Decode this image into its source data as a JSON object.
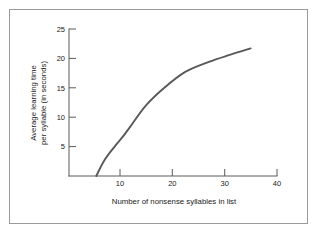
{
  "figure": {
    "background_color": "#ffffff",
    "border_color": "#9a9a9a",
    "curve_color": "#59595c",
    "axis_color": "#5a5a5a"
  },
  "chart_data": {
    "type": "line",
    "title": "",
    "xlabel": "Number of nonsense syllables in list",
    "ylabel": "Average learning time per syllable (in seconds)",
    "ylabel_line1": "Average learning time",
    "ylabel_line2": "per syllable (in seconds)",
    "xlim": [
      0,
      40
    ],
    "ylim": [
      0,
      25
    ],
    "xticks": [
      10,
      20,
      30,
      40
    ],
    "yticks": [
      5,
      10,
      15,
      20,
      25
    ],
    "xtick_labels": [
      "10",
      "20",
      "30",
      "40"
    ],
    "ytick_labels": [
      "5",
      "10",
      "15",
      "20",
      "25"
    ],
    "grid": false,
    "legend": false,
    "series": [
      {
        "name": "Average learning time per syllable",
        "x": [
          5.5,
          7.0,
          9.0,
          10.5,
          12.0,
          15.0,
          18.5,
          22.5,
          27.0,
          31.0,
          35.0
        ],
        "y": [
          0.0,
          2.6,
          5.0,
          6.6,
          8.4,
          12.0,
          15.0,
          17.7,
          19.4,
          20.6,
          21.7
        ]
      }
    ]
  }
}
